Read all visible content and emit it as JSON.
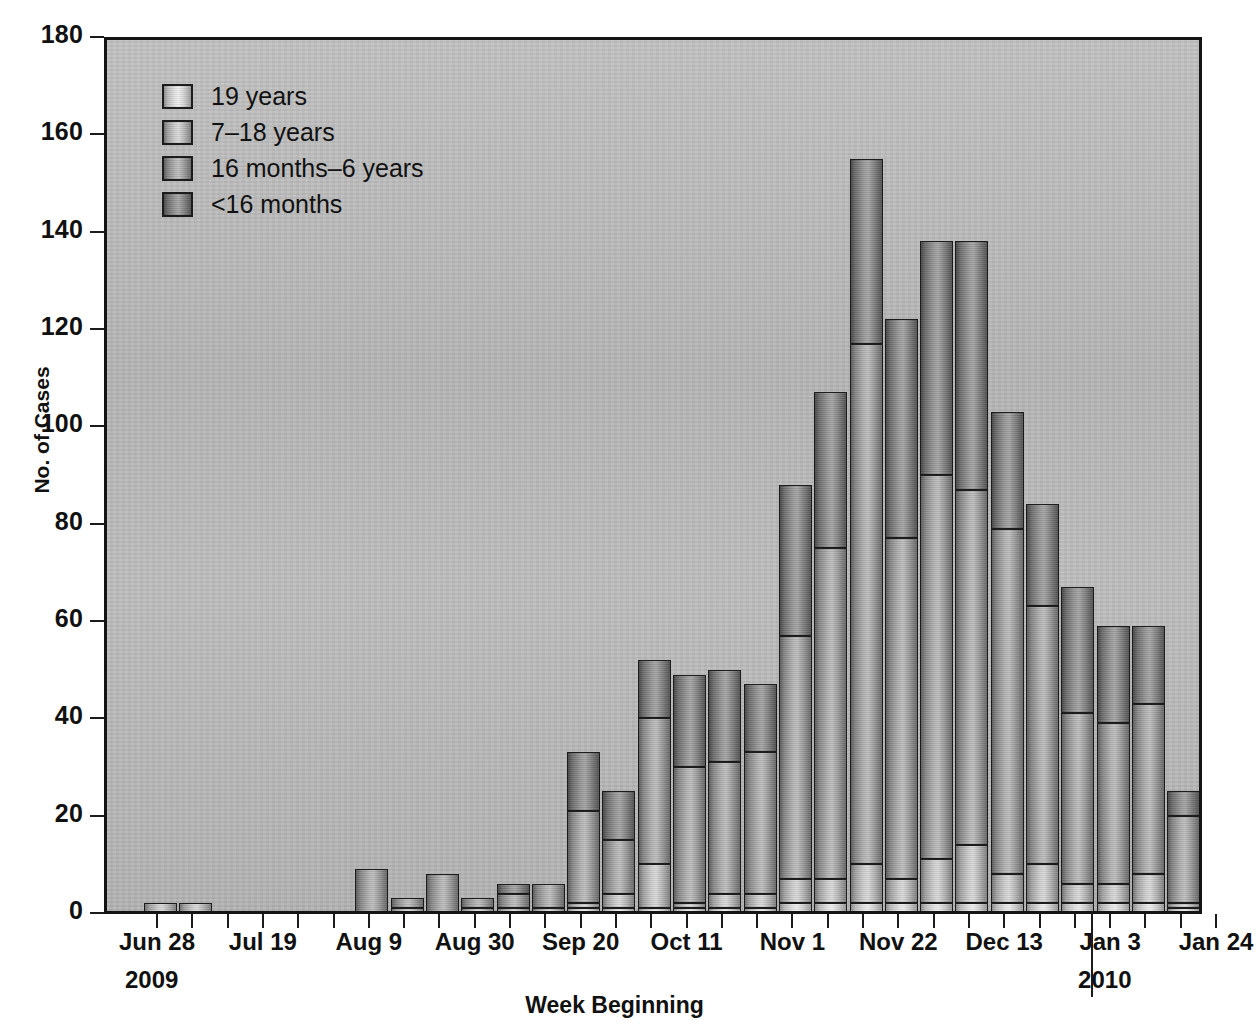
{
  "chart_data": {
    "type": "bar",
    "subtype": "stacked-bar",
    "title": "",
    "xlabel": "Week Beginning",
    "ylabel": "No. of Cases",
    "ylim": [
      0,
      180
    ],
    "yticks": [
      0,
      20,
      40,
      60,
      80,
      100,
      120,
      140,
      160,
      180
    ],
    "grid": false,
    "legend_position": "top-left",
    "year_divider_after_category": "Dec 27",
    "categories": [
      "Jun 28",
      "Jul 5",
      "Jul 12",
      "Jul 19",
      "Jul 26",
      "Aug 2",
      "Aug 9",
      "Aug 16",
      "Aug 23",
      "Aug 30",
      "Sep 6",
      "Sep 13",
      "Sep 20",
      "Sep 27",
      "Oct 4",
      "Oct 11",
      "Oct 18",
      "Oct 25",
      "Nov 1",
      "Nov 8",
      "Nov 15",
      "Nov 22",
      "Nov 29",
      "Dec 6",
      "Dec 13",
      "Dec 20",
      "Dec 27",
      "Jan 3",
      "Jan 10",
      "Jan 17",
      "Jan 24"
    ],
    "tick_labels": [
      {
        "category": "Jun 28",
        "label": "Jun 28"
      },
      {
        "category": "Jul 19",
        "label": "Jul 19"
      },
      {
        "category": "Aug 9",
        "label": "Aug 9"
      },
      {
        "category": "Aug 30",
        "label": "Aug 30"
      },
      {
        "category": "Sep 20",
        "label": "Sep 20"
      },
      {
        "category": "Oct 11",
        "label": "Oct 11"
      },
      {
        "category": "Nov 1",
        "label": "Nov 1"
      },
      {
        "category": "Nov 22",
        "label": "Nov 22"
      },
      {
        "category": "Dec 13",
        "label": "Dec 13"
      },
      {
        "category": "Jan 3",
        "label": "Jan 3"
      },
      {
        "category": "Jan 24",
        "label": "Jan 24"
      }
    ],
    "year_labels": [
      {
        "text": "2009",
        "after_category": "Jun 28"
      },
      {
        "text": "2010",
        "after_category": "Jan 3"
      }
    ],
    "series": [
      {
        "name": "<16 months",
        "color": "#6e6e6e",
        "values": [
          0,
          0,
          0,
          0,
          0,
          0,
          0,
          0,
          0,
          0,
          0,
          0,
          1,
          1,
          1,
          1,
          1,
          1,
          2,
          2,
          2,
          2,
          2,
          2,
          2,
          2,
          2,
          2,
          2,
          1,
          1
        ]
      },
      {
        "name": "16 months–6 years",
        "color": "#9a9a9a",
        "values": [
          2,
          2,
          0,
          0,
          0,
          0,
          0,
          1,
          0,
          1,
          1,
          1,
          1,
          3,
          9,
          1,
          3,
          3,
          5,
          5,
          8,
          5,
          9,
          12,
          6,
          8,
          4,
          4,
          6,
          1,
          2
        ]
      },
      {
        "name": "7–18 years",
        "color": "#c0c0c0",
        "values": [
          0,
          0,
          0,
          0,
          0,
          0,
          9,
          2,
          8,
          2,
          3,
          5,
          19,
          11,
          30,
          28,
          27,
          29,
          50,
          68,
          107,
          70,
          79,
          73,
          71,
          53,
          35,
          33,
          35,
          18,
          0
        ]
      },
      {
        "name": "19 years",
        "color": "#e4e4e4",
        "values": [
          0,
          0,
          0,
          0,
          0,
          0,
          0,
          0,
          0,
          0,
          2,
          0,
          12,
          10,
          12,
          19,
          19,
          14,
          31,
          32,
          38,
          45,
          48,
          51,
          24,
          21,
          26,
          20,
          16,
          5,
          0
        ]
      }
    ],
    "totals": [
      2,
      2,
      0,
      0,
      0,
      0,
      9,
      3,
      8,
      3,
      6,
      6,
      33,
      25,
      52,
      49,
      50,
      47,
      88,
      107,
      155,
      122,
      138,
      138,
      103,
      84,
      67,
      59,
      59,
      25,
      3
    ]
  },
  "legend": {
    "items": [
      {
        "label": "19 years",
        "swatch": "legend-swatch-19-years"
      },
      {
        "label": "7–18 years",
        "swatch": "legend-swatch-7-18-years"
      },
      {
        "label": "16 months–6 years",
        "swatch": "legend-swatch-16-months-6-years"
      },
      {
        "label": "<16 months",
        "swatch": "legend-swatch-under-16-months"
      }
    ]
  },
  "axes": {
    "y_title": "No. of Cases",
    "x_title": "Week Beginning",
    "y_tick_labels": [
      "180",
      "160",
      "140",
      "120",
      "100",
      "80",
      "60",
      "40",
      "20",
      "0"
    ]
  }
}
